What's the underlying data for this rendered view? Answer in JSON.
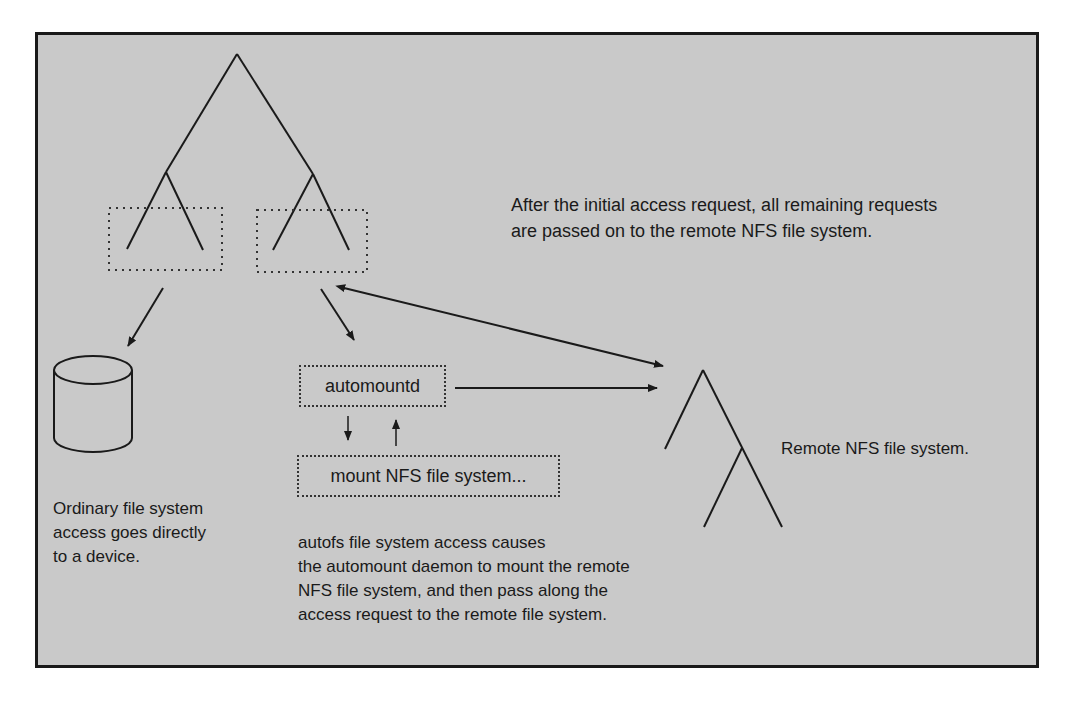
{
  "diagram": {
    "background_color": "#c9c9c9",
    "line_color": "#1a1a1a",
    "nodes": {
      "local_tree": "local-directory-tree",
      "disk": "device-cylinder",
      "automountd": "automountd",
      "mount_step": "mount NFS file system...",
      "remote_tree": "remote-nfs-tree"
    },
    "captions": {
      "after_initial": "After the initial access request, all remaining requests\nare passed on to the remote NFS file system.",
      "ordinary": "Ordinary file system\naccess goes directly\nto a device.",
      "autofs": "autofs file system access causes\nthe automount daemon to mount the remote\nNFS file system, and then pass along the\naccess request to the remote file system.",
      "remote": "Remote NFS file system."
    }
  }
}
